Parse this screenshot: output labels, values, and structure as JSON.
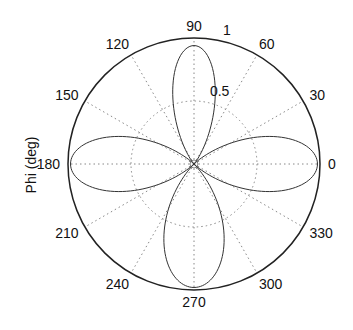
{
  "chart_data": {
    "type": "polar-line",
    "title": "",
    "ylabel": "Phi (deg)",
    "angular_ticks": [
      0,
      30,
      60,
      90,
      120,
      150,
      180,
      210,
      240,
      270,
      300,
      330
    ],
    "angular_tick_labels": [
      "0",
      "30",
      "60",
      "90",
      "120",
      "150",
      "180",
      "210",
      "240",
      "270",
      "300",
      "330"
    ],
    "radial_ticks": [
      0.5,
      1
    ],
    "radial_tick_labels": [
      "0.5",
      "1"
    ],
    "rlim": [
      0,
      1
    ],
    "grid": true,
    "series": [
      {
        "name": "pattern",
        "lobes": [
          {
            "center_deg": 0,
            "peak": 0.98,
            "halfwidth_deg": 45,
            "shape_exp": 1.6
          },
          {
            "center_deg": 90,
            "peak": 0.94,
            "halfwidth_deg": 45,
            "shape_exp": 2.6
          },
          {
            "center_deg": 180,
            "peak": 0.98,
            "halfwidth_deg": 45,
            "shape_exp": 1.6
          },
          {
            "center_deg": 270,
            "peak": 0.98,
            "halfwidth_deg": 45,
            "shape_exp": 1.3
          }
        ]
      }
    ]
  },
  "layout": {
    "cx": 194,
    "cy": 164,
    "r": 126,
    "line_color": "#333333",
    "grid_color": "#888888",
    "axis_color": "#222222"
  }
}
